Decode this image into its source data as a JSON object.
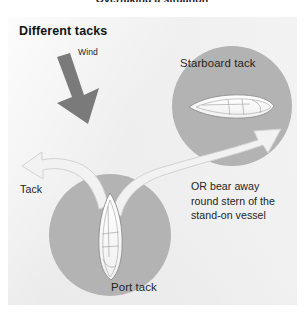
{
  "figure": {
    "top_caption": "Overtaking a situation",
    "panel_title": "Different tacks",
    "labels": {
      "wind": "Wind",
      "starboard_tack": "Starboard tack",
      "tack": "Tack",
      "port_tack": "Port tack"
    },
    "note": {
      "line1": "OR bear away",
      "line2": "round stern of the",
      "line3": "stand-on vessel"
    },
    "colors": {
      "panel_background": "#eeeeee",
      "circle_fill": "#b3b3b3",
      "wind_arrow": "#7a7a7a",
      "maneuver_arrow": "#f2f2f2",
      "maneuver_arrow_edge": "#cfcfcf",
      "boat_hull": "#ffffff",
      "boat_outline": "#8d8d8d",
      "text": "#232323"
    },
    "icons": {
      "wind": "wind-arrow-icon",
      "tack_path": "curved-arrow-icon",
      "bear_away_path": "curved-arrow-icon",
      "starboard_boat": "sailboat-icon",
      "port_boat": "sailboat-icon"
    }
  }
}
